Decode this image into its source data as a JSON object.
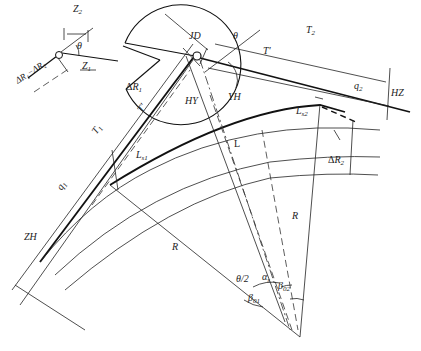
{
  "diagram": {
    "title": "",
    "labels": {
      "z2": "Z",
      "z2_sub": "2",
      "theta_inset": "θ",
      "z1": "Z",
      "z1_sub": "1",
      "delta_r_diff": "ΔR₁−ΔR₂",
      "jd": "JD",
      "theta": "θ",
      "t2": "T",
      "t2_sub": "2",
      "t_prime_top": "T′",
      "q2": "q",
      "q2_sub": "2",
      "hz": "HZ",
      "hy": "HY",
      "yh": "YH",
      "delta_r1": "ΔR",
      "delta_r1_sub": "1",
      "t_prime_left": "T′",
      "t1": "T",
      "t1_sub": "1",
      "ls2": "L",
      "ls2_sub": "s2",
      "ls1": "L",
      "ls1_sub": "s1",
      "l": "L",
      "delta_r2": "ΔR",
      "delta_r2_sub": "2",
      "q1": "q",
      "q1_sub": "1",
      "zh": "ZH",
      "r_left": "R",
      "r_right": "R",
      "theta_half": "θ/2",
      "alpha_s": "α",
      "alpha_s_sub": "s",
      "beta01": "β",
      "beta01_sub": "01",
      "beta02": "β",
      "beta02_sub": "02"
    },
    "points": {
      "JD": [
        197,
        55
      ],
      "center": [
        300,
        337
      ],
      "ZH": [
        40,
        262
      ],
      "HZ": [
        392,
        112
      ]
    }
  }
}
